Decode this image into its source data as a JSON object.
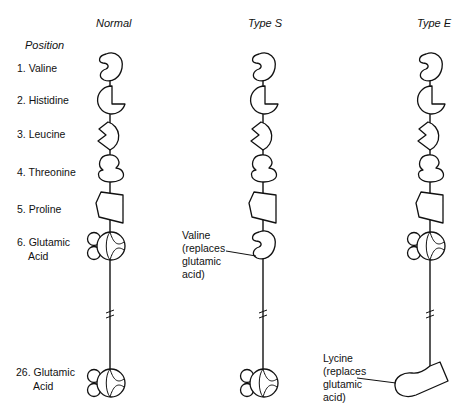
{
  "columns": [
    {
      "title": "Normal"
    },
    {
      "title": "Type S"
    },
    {
      "title": "Type E"
    }
  ],
  "position_header": "Position",
  "positions": [
    {
      "label": "1. Valine"
    },
    {
      "label": "2. Histidine"
    },
    {
      "label": "3. Leucine"
    },
    {
      "label": "4. Threonine"
    },
    {
      "label": "5. Proline"
    },
    {
      "label_line1": "6. Glutamic",
      "label_line2": "Acid"
    },
    {
      "label_line1": "26. Glutamic",
      "label_line2": "Acid"
    }
  ],
  "annotations": {
    "type_s": {
      "line1": "Valine",
      "line2": "(replaces",
      "line3": "glutamic",
      "line4": "acid)"
    },
    "type_e": {
      "line1": "Lycine",
      "line2": "(replaces",
      "line3": "glutamic",
      "line4": "acid)"
    }
  }
}
